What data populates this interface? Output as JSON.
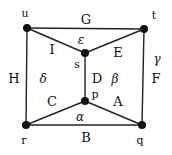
{
  "nodes": [
    {
      "id": "u",
      "label": "u",
      "x": 27,
      "y": 28,
      "lx": 25,
      "ly": 17
    },
    {
      "id": "t",
      "label": "t",
      "x": 144,
      "y": 29,
      "lx": 154,
      "ly": 19
    },
    {
      "id": "s",
      "label": "s",
      "x": 85,
      "y": 53,
      "lx": 77,
      "ly": 68
    },
    {
      "id": "p",
      "label": "p",
      "x": 85,
      "y": 101,
      "lx": 95,
      "ly": 98
    },
    {
      "id": "r",
      "label": "r",
      "x": 26,
      "y": 125,
      "lx": 24,
      "ly": 144
    },
    {
      "id": "q",
      "label": "q",
      "x": 142,
      "y": 125,
      "lx": 140,
      "ly": 144
    }
  ],
  "edges": [
    {
      "label": "G",
      "from": "u",
      "to": "t",
      "lx": 86,
      "ly": 24
    },
    {
      "label": "I",
      "from": "u",
      "to": "s",
      "lx": 52,
      "ly": 54
    },
    {
      "label": "E",
      "from": "s",
      "to": "t",
      "lx": 118,
      "ly": 57
    },
    {
      "label": "H",
      "from": "u",
      "to": "r",
      "lx": 14,
      "ly": 83
    },
    {
      "label": "D",
      "from": "s",
      "to": "p",
      "lx": 97,
      "ly": 83
    },
    {
      "label": "F",
      "from": "t",
      "to": "q",
      "lx": 156,
      "ly": 83
    },
    {
      "label": "C",
      "from": "r",
      "to": "p",
      "lx": 52,
      "ly": 106
    },
    {
      "label": "A",
      "from": "p",
      "to": "q",
      "lx": 118,
      "ly": 106
    },
    {
      "label": "B",
      "from": "r",
      "to": "q",
      "lx": 86,
      "ly": 142
    }
  ],
  "faces": [
    {
      "label": "ε",
      "lx": 81,
      "ly": 44
    },
    {
      "label": "γ",
      "lx": 157,
      "ly": 63
    },
    {
      "label": "δ",
      "lx": 43,
      "ly": 83
    },
    {
      "label": "β",
      "lx": 115,
      "ly": 83
    },
    {
      "label": "α",
      "lx": 80,
      "ly": 121
    }
  ]
}
